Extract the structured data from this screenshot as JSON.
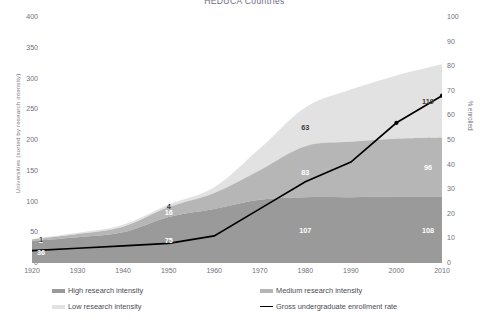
{
  "chart_data": {
    "type": "area",
    "title": "HEDUCA Countries",
    "xlabel": "",
    "ylabel": "Universities (sorted by research intensity)",
    "y2label": "% enrolled",
    "x": [
      1920,
      1930,
      1940,
      1950,
      1960,
      1970,
      1980,
      1990,
      2000,
      2010
    ],
    "xtick_labels": [
      "1920",
      "1930",
      "1940",
      "1950",
      "1960",
      "1970",
      "1980",
      "1990",
      "2000",
      "2010"
    ],
    "ylim": [
      0,
      400
    ],
    "ytick_labels": [
      "0",
      "50",
      "100",
      "150",
      "200",
      "250",
      "300",
      "350",
      "400"
    ],
    "y2lim": [
      0,
      100
    ],
    "y2tick_labels": [
      "0",
      "10",
      "20",
      "30",
      "40",
      "50",
      "60",
      "70",
      "80",
      "90",
      "100"
    ],
    "grid": false,
    "legend_position": "bottom",
    "series": [
      {
        "name": "High research intensity",
        "type": "area-stacked",
        "color": "#9a9a9a",
        "values": [
          36,
          42,
          50,
          75,
          88,
          103,
          107,
          107,
          108,
          108
        ],
        "labels": [
          {
            "x": 1920,
            "value": 36
          },
          {
            "x": 1950,
            "value": 75
          },
          {
            "x": 1980,
            "value": 107
          },
          {
            "x": 2010,
            "value": 108
          }
        ]
      },
      {
        "name": "Medium research intensity",
        "type": "area-stacked",
        "color": "#b6b6b6",
        "values": [
          2,
          5,
          9,
          16,
          26,
          48,
          83,
          90,
          94,
          96
        ],
        "labels": [
          {
            "x": 1920,
            "value": 2
          },
          {
            "x": 1950,
            "value": 16
          },
          {
            "x": 1980,
            "value": 83
          },
          {
            "x": 2010,
            "value": 96
          }
        ]
      },
      {
        "name": "Low research intensity",
        "type": "area-stacked",
        "color": "#e2e2e2",
        "values": [
          1,
          2,
          3,
          4,
          9,
          35,
          63,
          85,
          103,
          119
        ],
        "labels": [
          {
            "x": 1920,
            "value": 1
          },
          {
            "x": 1950,
            "value": 4
          },
          {
            "x": 1980,
            "value": 63
          },
          {
            "x": 2010,
            "value": 119
          }
        ]
      },
      {
        "name": "Gross undergraduate enrollment rate",
        "type": "line",
        "color": "#000000",
        "axis": "right",
        "values": [
          5,
          6,
          7,
          8,
          11,
          22,
          33,
          41,
          57,
          68
        ]
      }
    ]
  },
  "legend": {
    "high_label": "High research intensity",
    "medium_label": "Medium research intensity",
    "low_label": "Low research intensity",
    "rate_label": "Gross undergraduate enrollment rate"
  }
}
